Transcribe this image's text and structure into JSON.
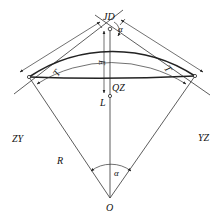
{
  "diagram": {
    "labels": {
      "jd": "JD",
      "alpha_top": "α",
      "e": "E",
      "qz": "QZ",
      "l": "L",
      "t_left": "T",
      "t_right": "T",
      "zy": "ZY",
      "yz": "YZ",
      "r": "R",
      "alpha_center": "α",
      "o": "O"
    },
    "colors": {
      "line": "#333333",
      "curve": "#222222",
      "background": "#ffffff"
    }
  }
}
